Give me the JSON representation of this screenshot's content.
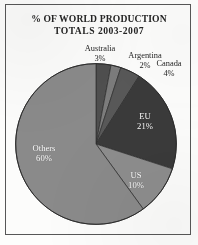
{
  "document": {
    "frame_border_color": "#575757",
    "page_background": "#fdfdfc"
  },
  "title": {
    "line1": "% OF WORLD PRODUCTION",
    "line2": "TOTALS 2003-2007"
  },
  "chart_data": {
    "type": "pie",
    "title": "% OF WORLD PRODUCTION TOTALS 2003-2007",
    "xlabel": "",
    "ylabel": "",
    "legend": "none",
    "grid": false,
    "units": "percent",
    "total": 100,
    "start_angle_deg": 0,
    "direction": "clockwise",
    "categories": [
      "Australia",
      "Argentina",
      "Canada",
      "EU",
      "US",
      "Others"
    ],
    "values": [
      3,
      2,
      4,
      21,
      10,
      60
    ],
    "colors": [
      "#4f4f4f",
      "#7c7c7c",
      "#585858",
      "#3a3a3a",
      "#8d8d8d",
      "#8a8a8a"
    ],
    "slices": [
      {
        "name": "Australia",
        "value": 3,
        "display_value": "3%",
        "color": "#4f4f4f",
        "label_placement": "outside",
        "label_text_color": "#1f1f1f"
      },
      {
        "name": "Argentina",
        "value": 2,
        "display_value": "2%",
        "color": "#7c7c7c",
        "label_placement": "outside",
        "label_text_color": "#1f1f1f"
      },
      {
        "name": "Canada",
        "value": 4,
        "display_value": "4%",
        "color": "#585858",
        "label_placement": "outside",
        "label_text_color": "#1f1f1f"
      },
      {
        "name": "EU",
        "value": 21,
        "display_value": "21%",
        "color": "#3a3a3a",
        "label_placement": "inside",
        "label_text_color": "#ffffff"
      },
      {
        "name": "US",
        "value": 10,
        "display_value": "10%",
        "color": "#8d8d8d",
        "label_placement": "inside",
        "label_text_color": "#ffffff"
      },
      {
        "name": "Others",
        "value": 60,
        "display_value": "60%",
        "color": "#8a8a8a",
        "label_placement": "inside",
        "label_text_color": "#ffffff"
      }
    ]
  }
}
